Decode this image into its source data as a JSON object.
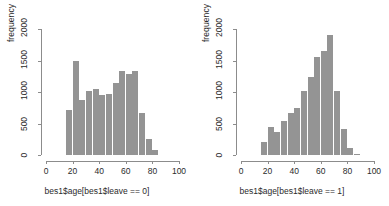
{
  "figure": {
    "panels": [
      {
        "name": "histogram-leave-0",
        "ylabel": "frequency",
        "xlabel": "bes1$age[bes1$leave == 0]"
      },
      {
        "name": "histogram-leave-1",
        "ylabel": "frequency",
        "xlabel": "bes1$age[bes1$leave == 1]"
      }
    ],
    "bar_color": "#949494",
    "axis_color": "#8c8c8c",
    "text_color": "#2b2b2b"
  },
  "chart_data": [
    {
      "type": "bar",
      "title": "",
      "subtitle": "",
      "xlabel": "bes1$age[bes1$leave == 0]",
      "ylabel": "frequency",
      "xlim": [
        0,
        100
      ],
      "ylim": [
        0,
        2000
      ],
      "xticks": [
        0,
        20,
        40,
        60,
        80,
        100
      ],
      "yticks": [
        0,
        500,
        1000,
        1500,
        2000
      ],
      "grid": false,
      "legend": "none",
      "bin_width": 5,
      "bin_starts": [
        15,
        20,
        25,
        30,
        35,
        40,
        45,
        50,
        55,
        60,
        65,
        70,
        75,
        80
      ],
      "categories": [
        "15-20",
        "20-25",
        "25-30",
        "30-35",
        "35-40",
        "40-45",
        "45-50",
        "50-55",
        "55-60",
        "60-65",
        "65-70",
        "70-75",
        "75-80",
        "80-85"
      ],
      "values": [
        720,
        1490,
        880,
        1020,
        1050,
        955,
        975,
        1150,
        1330,
        1285,
        1340,
        660,
        250,
        80
      ]
    },
    {
      "type": "bar",
      "title": "",
      "subtitle": "",
      "xlabel": "bes1$age[bes1$leave == 1]",
      "ylabel": "frequency",
      "xlim": [
        0,
        100
      ],
      "ylim": [
        0,
        2000
      ],
      "xticks": [
        0,
        20,
        40,
        60,
        80,
        100
      ],
      "yticks": [
        0,
        500,
        1000,
        1500,
        2000
      ],
      "grid": false,
      "legend": "none",
      "bin_width": 5,
      "bin_starts": [
        15,
        20,
        25,
        30,
        35,
        40,
        45,
        50,
        55,
        60,
        65,
        70,
        75,
        80,
        85
      ],
      "categories": [
        "15-20",
        "20-25",
        "25-30",
        "30-35",
        "35-40",
        "40-45",
        "45-50",
        "50-55",
        "55-60",
        "60-65",
        "65-70",
        "70-75",
        "75-80",
        "80-85",
        "85-90"
      ],
      "values": [
        205,
        440,
        370,
        540,
        670,
        750,
        1020,
        1240,
        1550,
        1650,
        1900,
        1020,
        410,
        115,
        15
      ]
    }
  ]
}
